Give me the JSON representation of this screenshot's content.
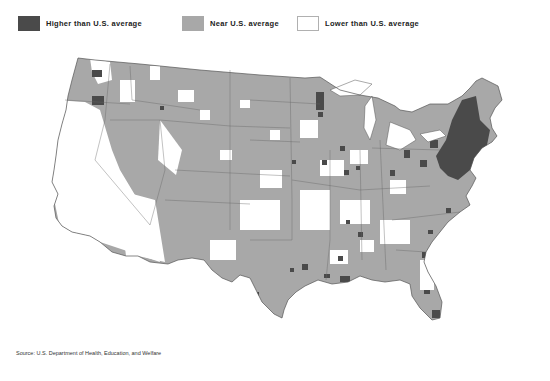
{
  "legend": {
    "items": [
      {
        "label": "Higher than U.S. average",
        "color": "#4a4a4a",
        "border": "#4a4a4a"
      },
      {
        "label": "Near U.S. average",
        "color": "#a8a8a8",
        "border": "#a8a8a8"
      },
      {
        "label": "Lower than U.S. average",
        "color": "#ffffff",
        "border": "#b0b0b0"
      }
    ]
  },
  "map": {
    "subject": "Contiguous United States by county",
    "colors": {
      "higher": "#4a4a4a",
      "near": "#a8a8a8",
      "lower": "#ffffff",
      "outline": "#555555"
    }
  },
  "source": "Source: U.S. Department of Health, Education, and Welfare"
}
